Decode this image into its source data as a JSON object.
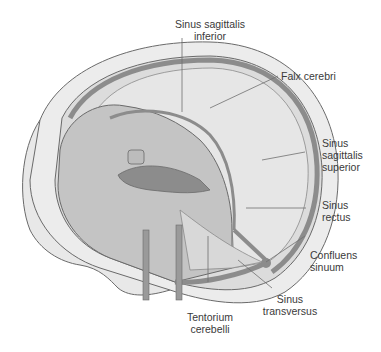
{
  "figure": {
    "colors": {
      "background": "#ffffff",
      "outline": "#6a6a6a",
      "sinus": "#8c8c8c",
      "dura": "#d9d9d9",
      "brain_cavity": "#bfbfbf",
      "leader_line": "#707070",
      "label_text": "#3a3a3a"
    }
  },
  "labels": {
    "sinus_sagittalis_inferior": {
      "line1": "Sinus sagittalis",
      "line2": "inferior"
    },
    "falx_cerebri": {
      "line1": "Falx cerebri"
    },
    "sinus_sagittalis_superior": {
      "line1": "Sinus",
      "line2": "sagittalis",
      "line3": "superior"
    },
    "sinus_rectus": {
      "line1": "Sinus",
      "line2": "rectus"
    },
    "confluens_sinuum": {
      "line1": "Confluens",
      "line2": "sinuum"
    },
    "sinus_transversus": {
      "line1": "Sinus",
      "line2": "transversus"
    },
    "tentorium_cerebelli": {
      "line1": "Tentorium",
      "line2": "cerebelli"
    }
  }
}
